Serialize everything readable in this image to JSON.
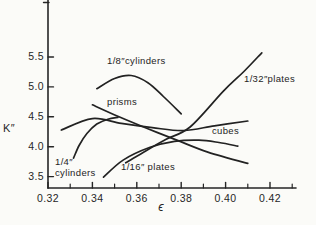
{
  "figure": {
    "background": "#fbfbf8",
    "ink": "#262626",
    "curve_color": "#222222"
  },
  "chart_data": {
    "type": "line",
    "title": "",
    "xlabel": "ϵ",
    "ylabel": "K″",
    "grid": false,
    "legend": "labels drawn beside each curve",
    "x_axis": {
      "min": 0.32,
      "max": 0.432,
      "major_ticks": [
        0.32,
        0.34,
        0.36,
        0.38,
        0.4,
        0.42
      ],
      "major_labels": [
        "0.32",
        "0.34",
        "0.36",
        "0.38",
        "0.40",
        "0.42"
      ],
      "minor_ticks": [
        0.33,
        0.35,
        0.37,
        0.39,
        0.41,
        0.43
      ]
    },
    "y_axis": {
      "min": 3.3,
      "max": 6.45,
      "ticks": [
        3.5,
        4.0,
        4.5,
        5.0,
        5.5
      ],
      "labels": [
        "3.5",
        "4.0",
        "4.5",
        "5.0",
        "5.5"
      ],
      "end_tick_at_top": true
    },
    "series": [
      {
        "name": "1/8 in. cylinders",
        "label_lines": [
          "1/8″cylinders"
        ],
        "label_px": [
          107,
          56
        ],
        "points": [
          [
            0.342,
            4.97
          ],
          [
            0.35,
            5.14
          ],
          [
            0.3575,
            5.19
          ],
          [
            0.365,
            5.07
          ],
          [
            0.372,
            4.84
          ],
          [
            0.38,
            4.55
          ]
        ]
      },
      {
        "name": "1/4 in. cylinders",
        "label_lines": [
          "1/4″",
          "cylinders"
        ],
        "label_px": [
          55,
          157
        ],
        "points": [
          [
            0.3315,
            3.81
          ],
          [
            0.334,
            4.02
          ],
          [
            0.3375,
            4.22
          ],
          [
            0.342,
            4.38
          ],
          [
            0.347,
            4.46
          ],
          [
            0.3515,
            4.49
          ]
        ]
      },
      {
        "name": "prisms",
        "label_lines": [
          "prisms"
        ],
        "label_px": [
          107,
          97
        ],
        "points": [
          [
            0.34,
            4.7
          ],
          [
            0.352,
            4.5
          ],
          [
            0.365,
            4.3
          ],
          [
            0.378,
            4.11
          ],
          [
            0.392,
            3.91
          ],
          [
            0.41,
            3.72
          ]
        ]
      },
      {
        "name": "cubes",
        "label_lines": [
          "cubes"
        ],
        "label_px": [
          212,
          126
        ],
        "points": [
          [
            0.326,
            4.28
          ],
          [
            0.34,
            4.47
          ],
          [
            0.353,
            4.39
          ],
          [
            0.367,
            4.32
          ],
          [
            0.381,
            4.27
          ],
          [
            0.395,
            4.35
          ],
          [
            0.41,
            4.43
          ]
        ]
      },
      {
        "name": "1/16 in. plates",
        "label_lines": [
          "1/16″ plates"
        ],
        "label_px": [
          121,
          162
        ],
        "points": [
          [
            0.345,
            3.49
          ],
          [
            0.354,
            3.78
          ],
          [
            0.366,
            3.99
          ],
          [
            0.377,
            4.09
          ],
          [
            0.388,
            4.11
          ],
          [
            0.397,
            4.07
          ],
          [
            0.4055,
            4.01
          ]
        ]
      },
      {
        "name": "1/32 in. plates",
        "label_lines": [
          "1/32″plates"
        ],
        "label_px": [
          244,
          74
        ],
        "points": [
          [
            0.355,
            3.73
          ],
          [
            0.364,
            3.93
          ],
          [
            0.373,
            4.12
          ],
          [
            0.384,
            4.33
          ],
          [
            0.399,
            4.93
          ],
          [
            0.408,
            5.25
          ],
          [
            0.4163,
            5.57
          ]
        ]
      }
    ]
  }
}
